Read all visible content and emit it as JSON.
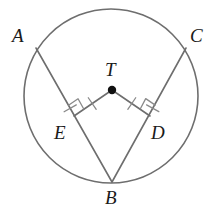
{
  "figure": {
    "background": "#ffffff",
    "stroke_color": "#6e6e6e",
    "label_color": "#1a1a1a",
    "mark_color": "#8a8a8a",
    "width": 217,
    "height": 213
  },
  "circle": {
    "name": "circle-T",
    "cx": 111,
    "cy": 96,
    "r": 87,
    "stroke_width": 1.6
  },
  "center_point": {
    "name": "point-T",
    "x": 112,
    "y": 90,
    "radius": 4.2,
    "fill": "#111111"
  },
  "points": {
    "A": {
      "x": 36,
      "y": 48
    },
    "C": {
      "x": 186,
      "y": 48
    },
    "B": {
      "x": 112,
      "y": 182
    },
    "T": {
      "x": 112,
      "y": 90
    },
    "E": {
      "x": 74,
      "y": 116
    },
    "D": {
      "x": 150,
      "y": 116
    }
  },
  "segments": [
    {
      "name": "chord-AB",
      "from": "A",
      "to": "B"
    },
    {
      "name": "chord-CB",
      "from": "C",
      "to": "B"
    },
    {
      "name": "radius-TE",
      "from": "T",
      "to": "E"
    },
    {
      "name": "radius-TD",
      "from": "T",
      "to": "D"
    }
  ],
  "right_angles": [
    {
      "name": "right-angle-mark-E",
      "at": "E",
      "size": 12
    },
    {
      "name": "right-angle-mark-D",
      "at": "D",
      "size": 12
    }
  ],
  "tick_marks": [
    {
      "name": "tick-mark-segment-TE",
      "on": "radius-TE"
    },
    {
      "name": "tick-mark-segment-TD",
      "on": "radius-TD"
    },
    {
      "name": "tick-mark-chord-AB",
      "on": "chord-AB"
    },
    {
      "name": "tick-mark-chord-CB",
      "on": "chord-CB"
    }
  ],
  "labels": [
    {
      "name": "label-A",
      "text": "A",
      "x": 12,
      "y": 26
    },
    {
      "name": "label-C",
      "text": "C",
      "x": 190,
      "y": 26
    },
    {
      "name": "label-T",
      "text": "T",
      "x": 105,
      "y": 60
    },
    {
      "name": "label-E",
      "text": "E",
      "x": 54,
      "y": 123
    },
    {
      "name": "label-D",
      "text": "D",
      "x": 151,
      "y": 123
    },
    {
      "name": "label-B",
      "text": "B",
      "x": 105,
      "y": 188
    }
  ]
}
